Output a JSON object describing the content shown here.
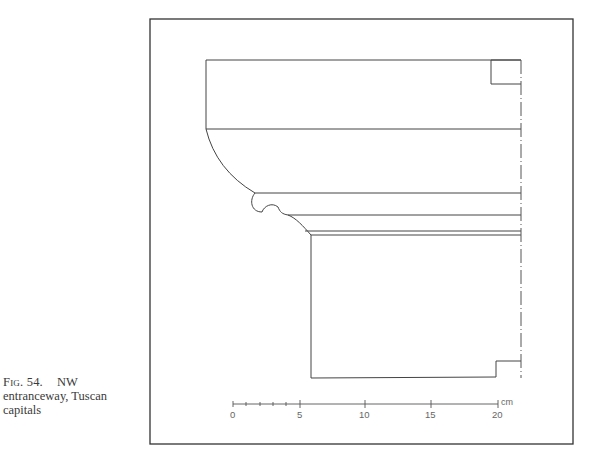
{
  "caption": {
    "label": "Fig. 54.",
    "text": "NW entranceway, Tuscan capitals",
    "line1": "NW",
    "line2": "entranceway, Tuscan",
    "line3": "capitals"
  },
  "drawing": {
    "subject": "Tuscan capital profile",
    "stroke_color": "#444444",
    "frame_color": "#333333"
  },
  "scale_bar": {
    "unit": "cm",
    "ticks": [
      "0",
      "5",
      "10",
      "15",
      "20"
    ],
    "minor_ticks": [
      1,
      2,
      3,
      4
    ]
  }
}
